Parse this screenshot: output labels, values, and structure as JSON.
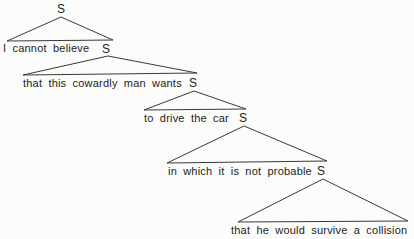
{
  "colors": {
    "background": "#fcfcfb",
    "line": "#3a3a3a",
    "text": "#1c1c1c"
  },
  "tree": {
    "root": "S",
    "nodes": [
      {
        "phrase": "I cannot believe",
        "s": "S"
      },
      {
        "phrase": "that this cowardly man wants",
        "s": "S"
      },
      {
        "phrase": "to drive the car",
        "s": "S"
      },
      {
        "phrase": "in which it is not probable",
        "s": "S"
      },
      {
        "phrase": "that he would survive a collision",
        "s": ""
      }
    ]
  }
}
